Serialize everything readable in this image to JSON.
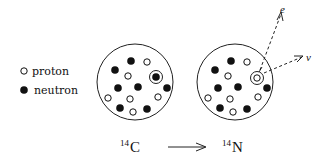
{
  "legend": {
    "proton_label": "proton",
    "neutron_label": "neutron"
  },
  "reaction": {
    "reactant": {
      "mass_number": "14",
      "symbol": "C"
    },
    "product": {
      "mass_number": "14",
      "symbol": "N"
    },
    "arrow": "⟶"
  },
  "emitted": {
    "electron_label": "e",
    "neutrino_label": "ν"
  },
  "nuclei": {
    "carbon": {
      "center": [
        135,
        81
      ],
      "particles": [
        {
          "x": 131,
          "y": 61,
          "type": "neutron"
        },
        {
          "x": 147,
          "y": 62,
          "type": "proton"
        },
        {
          "x": 115,
          "y": 70,
          "type": "neutron"
        },
        {
          "x": 128,
          "y": 76,
          "type": "proton"
        },
        {
          "x": 156,
          "y": 77,
          "type": "neutron",
          "highlight": true
        },
        {
          "x": 118,
          "y": 88,
          "type": "neutron"
        },
        {
          "x": 138,
          "y": 87,
          "type": "neutron"
        },
        {
          "x": 167,
          "y": 88,
          "type": "neutron"
        },
        {
          "x": 108,
          "y": 98,
          "type": "proton"
        },
        {
          "x": 130,
          "y": 99,
          "type": "proton"
        },
        {
          "x": 158,
          "y": 97,
          "type": "proton"
        },
        {
          "x": 120,
          "y": 108,
          "type": "neutron"
        },
        {
          "x": 133,
          "y": 112,
          "type": "proton"
        },
        {
          "x": 147,
          "y": 109,
          "type": "neutron"
        }
      ]
    },
    "nitrogen": {
      "center": [
        235,
        81
      ],
      "particles": [
        {
          "x": 231,
          "y": 61,
          "type": "neutron"
        },
        {
          "x": 247,
          "y": 62,
          "type": "proton"
        },
        {
          "x": 215,
          "y": 70,
          "type": "neutron"
        },
        {
          "x": 228,
          "y": 76,
          "type": "proton"
        },
        {
          "x": 257,
          "y": 78,
          "type": "proton",
          "highlight": true
        },
        {
          "x": 218,
          "y": 88,
          "type": "neutron"
        },
        {
          "x": 238,
          "y": 87,
          "type": "neutron"
        },
        {
          "x": 267,
          "y": 88,
          "type": "neutron"
        },
        {
          "x": 208,
          "y": 98,
          "type": "proton"
        },
        {
          "x": 230,
          "y": 99,
          "type": "proton"
        },
        {
          "x": 258,
          "y": 97,
          "type": "proton"
        },
        {
          "x": 220,
          "y": 108,
          "type": "neutron"
        },
        {
          "x": 233,
          "y": 112,
          "type": "proton"
        },
        {
          "x": 247,
          "y": 109,
          "type": "neutron"
        }
      ]
    }
  }
}
